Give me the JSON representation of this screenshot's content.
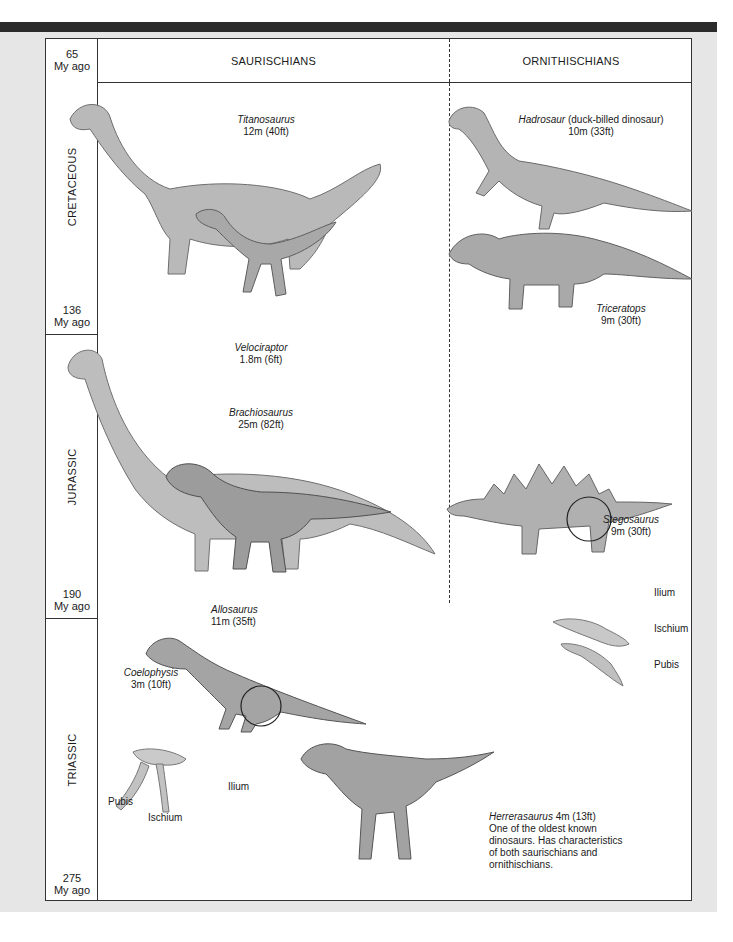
{
  "header": {
    "saurischians": "SAURISCHIANS",
    "ornithischians": "ORNITHISCHIANS"
  },
  "timeline": {
    "eras": [
      {
        "name": "CRETACEOUS",
        "start_label_num": "65",
        "start_label_unit": "My ago",
        "end_label_num": "136",
        "end_label_unit": "My ago"
      },
      {
        "name": "JURASSIC",
        "end_label_num": "190",
        "end_label_unit": "My ago"
      },
      {
        "name": "TRIASSIC",
        "end_label_num": "275",
        "end_label_unit": "My ago"
      }
    ]
  },
  "dinosaurs": {
    "titanosaurus": {
      "name": "Titanosaurus",
      "size": "12m (40ft)"
    },
    "velociraptor": {
      "name": "Velociraptor",
      "size": "1.8m (6ft)"
    },
    "hadrosaur": {
      "name": "Hadrosaur",
      "note": " (duck-billed dinosaur)",
      "size": "10m (33ft)"
    },
    "triceratops": {
      "name": "Triceratops",
      "size": "9m (30ft)"
    },
    "brachiosaurus": {
      "name": "Brachiosaurus",
      "size": "25m (82ft)"
    },
    "allosaurus": {
      "name": "Allosaurus",
      "size": "11m (35ft)"
    },
    "stegosaurus": {
      "name": "Stegosaurus",
      "size": "9m (30ft)"
    },
    "coelophysis": {
      "name": "Coelophysis",
      "size": "3m (10ft)"
    },
    "herrerasaurus": {
      "name": "Herrerasaurus",
      "size": " 4m (13ft)",
      "description": "One of the oldest known dinosaurs. Has characteristics of both saurischians and ornithischians."
    }
  },
  "hip_labels": {
    "ornithischian": {
      "ilium": "Ilium",
      "ischium": "Ischium",
      "pubis": "Pubis"
    },
    "saurischian": {
      "ilium": "Ilium",
      "ischium": "Ischium",
      "pubis": "Pubis"
    }
  }
}
